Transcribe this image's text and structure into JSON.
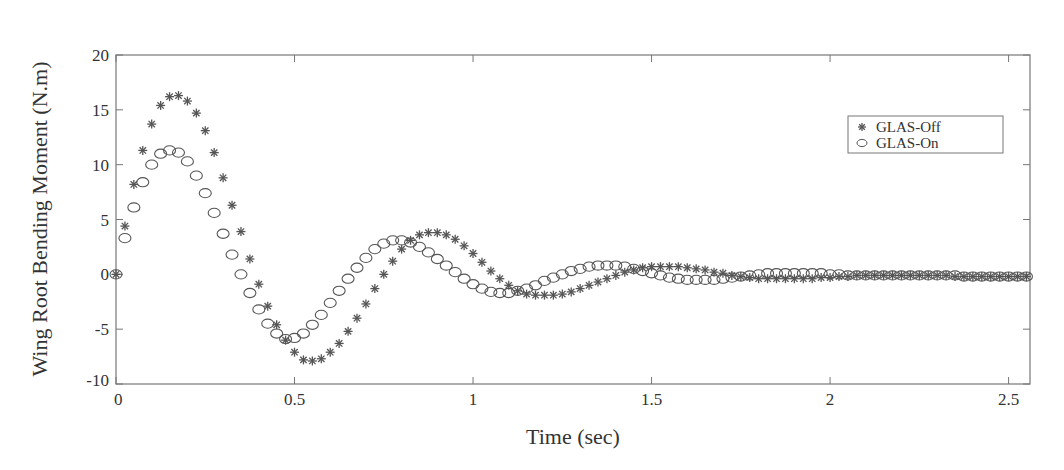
{
  "chart_data": {
    "type": "scatter",
    "title": "",
    "xlabel": "Time (sec)",
    "ylabel": "Wing Root Bending Moment (N.m)",
    "xlim": [
      0,
      2.56
    ],
    "ylim": [
      -10,
      20
    ],
    "xticks": [
      0,
      0.5,
      1,
      1.5,
      2,
      2.5
    ],
    "xtick_labels": [
      "0",
      "0.5",
      "1",
      "1.5",
      "2",
      "2.5"
    ],
    "yticks": [
      -10,
      -5,
      0,
      5,
      10,
      15,
      20
    ],
    "ytick_labels": [
      "-10",
      "-5",
      "0",
      "5",
      "10",
      "15",
      "20"
    ],
    "grid": false,
    "legend_position": "upper right",
    "series": [
      {
        "name": "GLAS-Off",
        "marker": "asterisk",
        "color": "#555555",
        "x": [
          0,
          0.025,
          0.05,
          0.075,
          0.1,
          0.125,
          0.15,
          0.175,
          0.2,
          0.225,
          0.25,
          0.275,
          0.3,
          0.325,
          0.35,
          0.375,
          0.4,
          0.425,
          0.45,
          0.475,
          0.5,
          0.525,
          0.55,
          0.575,
          0.6,
          0.625,
          0.65,
          0.675,
          0.7,
          0.725,
          0.75,
          0.775,
          0.8,
          0.825,
          0.85,
          0.875,
          0.9,
          0.925,
          0.95,
          0.975,
          1.0,
          1.025,
          1.05,
          1.075,
          1.1,
          1.125,
          1.15,
          1.175,
          1.2,
          1.225,
          1.25,
          1.275,
          1.3,
          1.325,
          1.35,
          1.375,
          1.4,
          1.425,
          1.45,
          1.475,
          1.5,
          1.525,
          1.55,
          1.575,
          1.6,
          1.625,
          1.65,
          1.675,
          1.7,
          1.725,
          1.75,
          1.775,
          1.8,
          1.825,
          1.85,
          1.875,
          1.9,
          1.925,
          1.95,
          1.975,
          2.0,
          2.025,
          2.05,
          2.075,
          2.1,
          2.125,
          2.15,
          2.175,
          2.2,
          2.225,
          2.25,
          2.275,
          2.3,
          2.325,
          2.35,
          2.375,
          2.4,
          2.425,
          2.45,
          2.475,
          2.5,
          2.525,
          2.55
        ],
        "y": [
          0,
          4.4,
          8.2,
          11.3,
          13.7,
          15.4,
          16.2,
          16.3,
          15.8,
          14.7,
          13.1,
          11.1,
          8.8,
          6.3,
          3.9,
          1.4,
          -0.9,
          -2.9,
          -4.6,
          -6.0,
          -7.1,
          -7.8,
          -7.9,
          -7.7,
          -7.1,
          -6.3,
          -5.2,
          -4.0,
          -2.7,
          -1.3,
          0.0,
          1.2,
          2.3,
          3.1,
          3.6,
          3.8,
          3.8,
          3.6,
          3.2,
          2.6,
          1.9,
          1.1,
          0.3,
          -0.4,
          -1.0,
          -1.5,
          -1.8,
          -1.9,
          -1.9,
          -1.9,
          -1.8,
          -1.6,
          -1.3,
          -1.0,
          -0.7,
          -0.4,
          -0.1,
          0.2,
          0.4,
          0.6,
          0.7,
          0.7,
          0.7,
          0.7,
          0.6,
          0.5,
          0.4,
          0.2,
          0.1,
          -0.1,
          -0.2,
          -0.3,
          -0.4,
          -0.4,
          -0.4,
          -0.4,
          -0.4,
          -0.4,
          -0.4,
          -0.3,
          -0.3,
          -0.2,
          -0.2,
          -0.1,
          -0.1,
          -0.1,
          -0.1,
          -0.1,
          -0.1,
          -0.1,
          -0.1,
          -0.1,
          -0.1,
          -0.1,
          -0.2,
          -0.2,
          -0.2,
          -0.2,
          -0.2,
          -0.2,
          -0.2,
          -0.2,
          -0.2
        ]
      },
      {
        "name": "GLAS-On",
        "marker": "circle",
        "color": "#555555",
        "x": [
          0,
          0.025,
          0.05,
          0.075,
          0.1,
          0.125,
          0.15,
          0.175,
          0.2,
          0.225,
          0.25,
          0.275,
          0.3,
          0.325,
          0.35,
          0.375,
          0.4,
          0.425,
          0.45,
          0.475,
          0.5,
          0.525,
          0.55,
          0.575,
          0.6,
          0.625,
          0.65,
          0.675,
          0.7,
          0.725,
          0.75,
          0.775,
          0.8,
          0.825,
          0.85,
          0.875,
          0.9,
          0.925,
          0.95,
          0.975,
          1.0,
          1.025,
          1.05,
          1.075,
          1.1,
          1.125,
          1.15,
          1.175,
          1.2,
          1.225,
          1.25,
          1.275,
          1.3,
          1.325,
          1.35,
          1.375,
          1.4,
          1.425,
          1.45,
          1.475,
          1.5,
          1.525,
          1.55,
          1.575,
          1.6,
          1.625,
          1.65,
          1.675,
          1.7,
          1.725,
          1.75,
          1.775,
          1.8,
          1.825,
          1.85,
          1.875,
          1.9,
          1.925,
          1.95,
          1.975,
          2.0,
          2.025,
          2.05,
          2.075,
          2.1,
          2.125,
          2.15,
          2.175,
          2.2,
          2.225,
          2.25,
          2.275,
          2.3,
          2.325,
          2.35,
          2.375,
          2.4,
          2.425,
          2.45,
          2.475,
          2.5,
          2.525,
          2.55
        ],
        "y": [
          0,
          3.3,
          6.1,
          8.4,
          10.0,
          11.0,
          11.3,
          11.1,
          10.3,
          9.0,
          7.4,
          5.6,
          3.7,
          1.8,
          0.0,
          -1.7,
          -3.2,
          -4.5,
          -5.4,
          -5.9,
          -5.8,
          -5.4,
          -4.6,
          -3.7,
          -2.6,
          -1.5,
          -0.4,
          0.6,
          1.5,
          2.3,
          2.8,
          3.1,
          3.1,
          2.9,
          2.5,
          2.0,
          1.4,
          0.8,
          0.2,
          -0.4,
          -0.9,
          -1.3,
          -1.6,
          -1.7,
          -1.7,
          -1.5,
          -1.3,
          -1.0,
          -0.6,
          -0.3,
          0.0,
          0.3,
          0.5,
          0.7,
          0.8,
          0.8,
          0.8,
          0.7,
          0.5,
          0.3,
          0.1,
          -0.1,
          -0.3,
          -0.4,
          -0.5,
          -0.5,
          -0.5,
          -0.5,
          -0.4,
          -0.3,
          -0.2,
          -0.1,
          0.0,
          0.1,
          0.1,
          0.1,
          0.1,
          0.1,
          0.1,
          0.1,
          0.0,
          0.0,
          -0.1,
          -0.1,
          -0.1,
          -0.1,
          -0.1,
          -0.1,
          -0.1,
          -0.1,
          -0.1,
          -0.1,
          -0.1,
          -0.1,
          -0.1,
          -0.2,
          -0.2,
          -0.2,
          -0.2,
          -0.2,
          -0.2,
          -0.2,
          -0.2
        ]
      }
    ]
  },
  "legend": {
    "items": [
      {
        "label": "GLAS-Off",
        "marker": "asterisk"
      },
      {
        "label": "GLAS-On",
        "marker": "circle"
      }
    ]
  },
  "axes": {
    "xlabel": "Time (sec)",
    "ylabel": "Wing Root Bending Moment (N.m)"
  },
  "colors": {
    "axis": "#777777",
    "marker": "#555555",
    "text": "#333333"
  }
}
